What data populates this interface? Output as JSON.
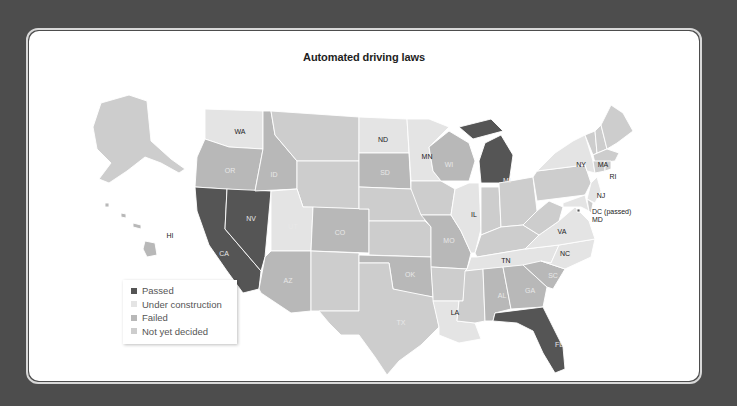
{
  "title": "Automated driving laws",
  "colors": {
    "background": "#4d4d4d",
    "panel": "#ffffff",
    "passed": "#555555",
    "under_construction": "#e4e4e4",
    "failed": "#b8b8b8",
    "not_yet_decided": "#cdcdcd"
  },
  "legend": [
    {
      "key": "passed",
      "label": "Passed",
      "color": "#555555"
    },
    {
      "key": "under_construction",
      "label": "Under construction",
      "color": "#e4e4e4"
    },
    {
      "key": "failed",
      "label": "Failed",
      "color": "#b8b8b8"
    },
    {
      "key": "not_yet_decided",
      "label": "Not yet decided",
      "color": "#cdcdcd"
    }
  ],
  "labels": {
    "WA": "WA",
    "OR": "OR",
    "CA": "CA",
    "NV": "NV",
    "ID": "ID",
    "UT": "UT",
    "AZ": "AZ",
    "CO": "CO",
    "ND": "ND",
    "SD": "SD",
    "MN": "MN",
    "WI": "WI",
    "MI": "MI",
    "IL": "IL",
    "MO": "MO",
    "OK": "OK",
    "TX": "TX",
    "LA": "LA",
    "TN": "TN",
    "AL": "AL",
    "GA": "GA",
    "FL": "FL",
    "SC": "SC",
    "NC": "NC",
    "VA": "VA",
    "NY": "NY",
    "MA": "MA",
    "RI": "RI",
    "NJ": "NJ",
    "DC": "DC (passed)",
    "MD": "MD",
    "HI": "HI"
  },
  "states": {
    "passed": [
      "CA",
      "NV",
      "MI",
      "FL",
      "DC"
    ],
    "under_construction": [
      "WA",
      "UT",
      "ND",
      "MN",
      "IL",
      "LA",
      "TN",
      "VA",
      "NC",
      "NY",
      "NJ",
      "MD"
    ],
    "failed": [
      "OR",
      "ID",
      "CO",
      "SD",
      "WI",
      "MO",
      "OK",
      "AZ",
      "AL",
      "GA",
      "SC",
      "HI"
    ],
    "not_yet_decided": [
      "AK",
      "MT",
      "WY",
      "NE",
      "KS",
      "IA",
      "NM",
      "TX",
      "AR",
      "MS",
      "KY",
      "IN",
      "OH",
      "WV",
      "PA",
      "ME",
      "VT",
      "NH",
      "CT",
      "MA",
      "RI",
      "DE"
    ]
  }
}
